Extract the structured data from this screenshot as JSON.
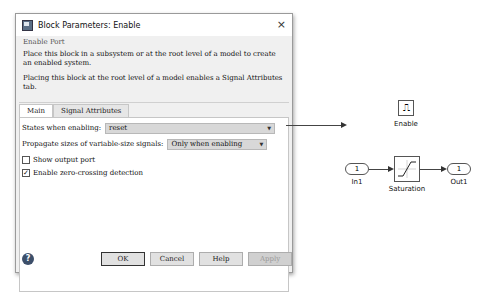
{
  "dialog": {
    "title": "Block Parameters: Enable",
    "close_label": "×",
    "group_title": "Enable Port",
    "description1": "Place this block in a subsystem or at the root level of a model to create an enabled system.",
    "description2": "Placing this block at the root level of a model enables a Signal Attributes tab.",
    "tabs": [
      {
        "label": "Main",
        "active": true
      },
      {
        "label": "Signal Attributes",
        "active": false
      }
    ],
    "main": {
      "states_label": "States when enabling:",
      "states_value": "reset",
      "propagate_label": "Propagate sizes of variable-size signals:",
      "propagate_value": "Only when enabling",
      "show_output_port": {
        "label": "Show output port",
        "checked": false
      },
      "zero_crossing": {
        "label": "Enable zero-crossing detection",
        "checked": true,
        "mark": "✓"
      }
    },
    "buttons": {
      "help_icon": "?",
      "ok": "OK",
      "cancel": "Cancel",
      "help": "Help",
      "apply": "Apply"
    }
  },
  "model": {
    "enable_block": {
      "label": "Enable",
      "glyph": "⎍"
    },
    "in1": {
      "number": "1",
      "label": "In1"
    },
    "saturation": {
      "label": "Saturation"
    },
    "out1": {
      "number": "1",
      "label": "Out1"
    }
  }
}
